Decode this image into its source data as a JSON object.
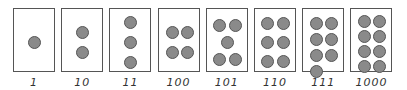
{
  "diagram": {
    "cards": [
      {
        "label": "1",
        "count": 1,
        "dots": [
          [
            14,
            27
          ]
        ]
      },
      {
        "label": "10",
        "count": 2,
        "dots": [
          [
            14,
            17
          ],
          [
            14,
            37
          ]
        ]
      },
      {
        "label": "11",
        "count": 3,
        "dots": [
          [
            14,
            7
          ],
          [
            14,
            27
          ],
          [
            14,
            47
          ]
        ]
      },
      {
        "label": "100",
        "count": 4,
        "dots": [
          [
            7,
            17
          ],
          [
            22,
            17
          ],
          [
            7,
            37
          ],
          [
            22,
            37
          ]
        ]
      },
      {
        "label": "101",
        "count": 5,
        "dots": [
          [
            6,
            10
          ],
          [
            22,
            10
          ],
          [
            14,
            27
          ],
          [
            6,
            44
          ],
          [
            22,
            44
          ]
        ]
      },
      {
        "label": "110",
        "count": 6,
        "dots": [
          [
            6,
            8
          ],
          [
            22,
            8
          ],
          [
            6,
            27
          ],
          [
            22,
            27
          ],
          [
            6,
            46
          ],
          [
            22,
            46
          ]
        ]
      },
      {
        "label": "111",
        "count": 7,
        "dots": [
          [
            7,
            8
          ],
          [
            22,
            8
          ],
          [
            7,
            24
          ],
          [
            22,
            24
          ],
          [
            7,
            40
          ],
          [
            22,
            40
          ],
          [
            7,
            56
          ]
        ]
      },
      {
        "label": "1000",
        "count": 8,
        "dots": [
          [
            7,
            6
          ],
          [
            22,
            6
          ],
          [
            7,
            21
          ],
          [
            22,
            21
          ],
          [
            7,
            36
          ],
          [
            22,
            36
          ],
          [
            7,
            51
          ],
          [
            22,
            51
          ]
        ]
      }
    ],
    "colors": {
      "dot_fill": "#8a8a8a",
      "dot_stroke": "#555555",
      "border": "#555555"
    }
  }
}
